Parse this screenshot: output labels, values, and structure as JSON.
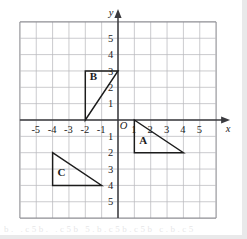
{
  "figure": {
    "name": "coordinate-plane-with-triangles",
    "type": "cartesian-grid"
  },
  "chart_data": {
    "type": "scatter",
    "title": "",
    "xlabel": "x",
    "ylabel": "y",
    "xlim": [
      -6,
      6
    ],
    "ylim": [
      -6,
      6
    ],
    "grid": true,
    "legend": "none",
    "origin_label": "O",
    "x_tick_labels": [
      "-5",
      "-4",
      "-3",
      "-2",
      "-1",
      "1",
      "2",
      "3",
      "4",
      "5"
    ],
    "x_tick_values": [
      -5,
      -4,
      -3,
      -2,
      -1,
      1,
      2,
      3,
      4,
      5
    ],
    "y_tick_labels_positive": [
      "5",
      "4",
      "3",
      "2",
      "1"
    ],
    "y_tick_values_positive": [
      5,
      4,
      3,
      2,
      1
    ],
    "y_tick_labels_negative": [
      "1",
      "2",
      "3",
      "4",
      "5"
    ],
    "y_tick_values_negative": [
      -1,
      -2,
      -3,
      -4,
      -5
    ],
    "series": [
      {
        "name": "A",
        "label": "A",
        "label_position": [
          1.55,
          -1.45
        ],
        "vertices": [
          [
            1,
            0
          ],
          [
            1,
            -2
          ],
          [
            4,
            -2
          ]
        ],
        "closed": true
      },
      {
        "name": "B",
        "label": "B",
        "label_position": [
          -1.5,
          2.45
        ],
        "vertices": [
          [
            -2,
            3
          ],
          [
            -2,
            0
          ],
          [
            0,
            3
          ]
        ],
        "closed": true
      },
      {
        "name": "C",
        "label": "C",
        "label_position": [
          -3.45,
          -3.4
        ],
        "vertices": [
          [
            -4,
            -2
          ],
          [
            -4,
            -4
          ],
          [
            -1,
            -4
          ]
        ],
        "closed": true
      }
    ]
  },
  "style": {
    "grid_color": "#b9b9bd",
    "grid_border_color": "#8e8e93",
    "axis_color": "#3a3a3e",
    "shape_color": "#1c1c1c",
    "label_color": "#1c1c1c",
    "background": "#ffffff"
  },
  "artifact": {
    "bottom_smudge_text": "b. .c5b. .c5b  5.b.c5b.c5b  c.b.c5"
  }
}
